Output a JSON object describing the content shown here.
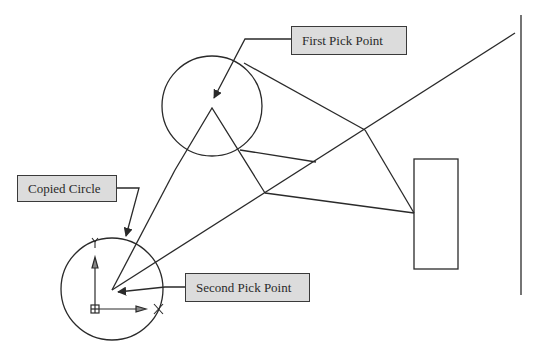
{
  "diagram": {
    "type": "cad-copy-command-illustration",
    "labels": {
      "first_pick_point": "First Pick Point",
      "copied_circle": "Copied Circle",
      "second_pick_point": "Second Pick Point"
    },
    "colors": {
      "line": "#2a2a2a",
      "label_fill": "#dcdcdc",
      "label_border": "#3a3a3a",
      "background": "#ffffff"
    },
    "shapes": {
      "original_circle": {
        "cx": 212,
        "cy": 106,
        "r": 50
      },
      "copied_circle": {
        "cx": 112,
        "cy": 289,
        "r": 51
      },
      "rectangle": {
        "x": 414,
        "y": 159,
        "w": 44,
        "h": 110
      },
      "vertical_line": {
        "x": 521,
        "y1": 15,
        "y2": 295
      }
    },
    "icons": [
      "ucs-icon",
      "grip-marker-icon",
      "arrowhead-icon"
    ]
  }
}
